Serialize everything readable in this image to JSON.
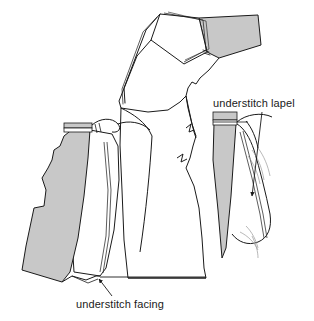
{
  "illustration": {
    "title": "Understitching facing and lapel — tailoring diagram",
    "subject": "jacket front with lapel, facing and understitching",
    "background_color": "#ffffff",
    "line_color": "#1a1a1a",
    "fabric_shade_color": "#c8c8c8",
    "wisp_line_color": "#9a9a9a",
    "stitch_line_color": "#333333"
  },
  "annotations": [
    {
      "id": "understitch-lapel",
      "label": "understitch lapel",
      "text_x": 213,
      "text_y": 107,
      "leader": "from label down-left to arrowhead on lapel roll line",
      "arrow_tip_x": 252,
      "arrow_tip_y": 198
    },
    {
      "id": "understitch-facing",
      "label": "understitch facing",
      "text_x": 76,
      "text_y": 308,
      "leader": "from label up-left to arrowhead on facing edge",
      "arrow_tip_x": 97,
      "arrow_tip_y": 277
    }
  ],
  "parts": [
    {
      "id": "top-collar-unit",
      "name": "folded collar and under-collar",
      "shaded": true,
      "description": "upper collar folded back showing shaded under-collar at right"
    },
    {
      "id": "left-front-facing",
      "name": "jacket front with facing turned out",
      "shaded": true,
      "description": "shaded facing panel along the front edge with banded shoulder seam"
    },
    {
      "id": "center-body",
      "name": "jacket body front",
      "shaded": false,
      "description": "white body piece with notched lapel edge"
    },
    {
      "id": "right-inset-lapel",
      "name": "lapel detail inset",
      "shaded": true,
      "description": "tapered shaded facing wedge with rolled lapel and understitch line"
    }
  ]
}
